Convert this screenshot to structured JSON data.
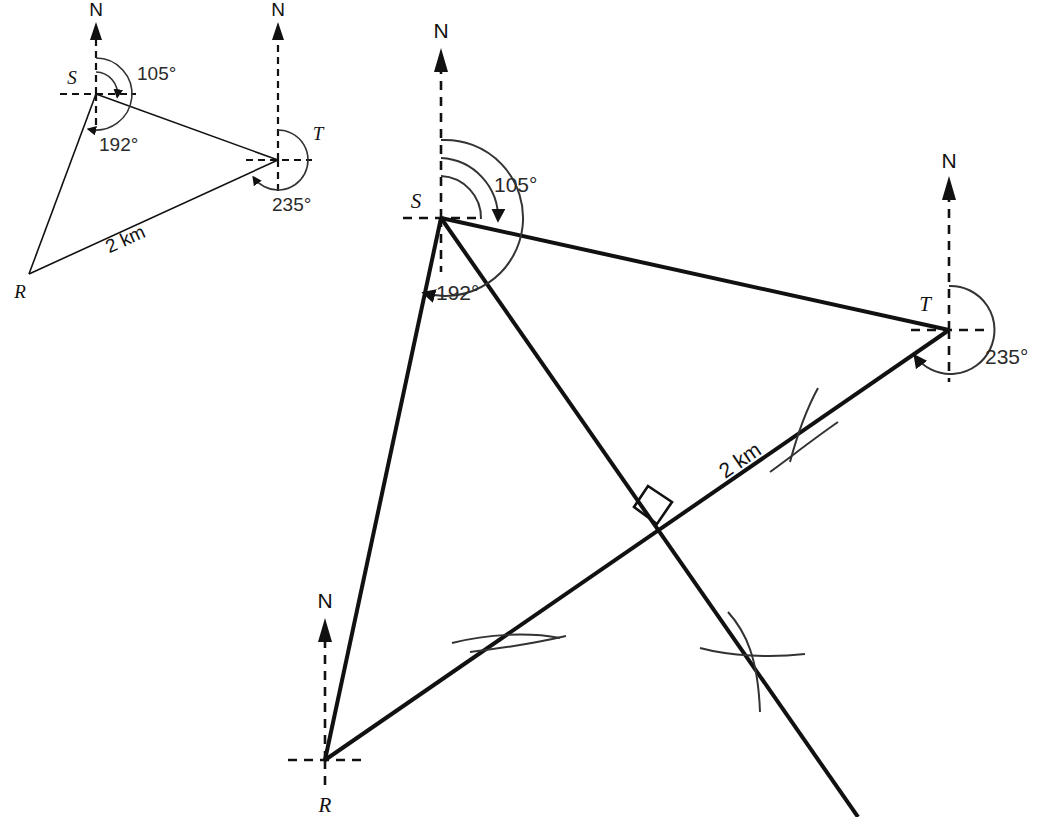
{
  "figure": {
    "type": "geometry-bearings-diagram",
    "background_color": "#ffffff",
    "ink_color": "#111111",
    "width": 1042,
    "height": 817
  },
  "small_diagram": {
    "name": "sketch-triangle-RST",
    "points": {
      "R": {
        "label": "R",
        "x": 29,
        "y": 274
      },
      "S": {
        "label": "S",
        "x": 96,
        "y": 94
      },
      "T": {
        "label": "T",
        "x": 286,
        "y": 160
      }
    },
    "north_labels": [
      {
        "label": "N",
        "at": "S",
        "x": 96,
        "y": 18
      },
      {
        "label": "N",
        "at": "T",
        "x": 278,
        "y": 18
      }
    ],
    "angles": [
      {
        "label": "105°",
        "vertex": "S",
        "x": 137,
        "y": 80,
        "value": 105
      },
      {
        "label": "192°",
        "vertex": "S",
        "x": 99,
        "y": 151,
        "value": 192
      },
      {
        "label": "235°",
        "vertex": "T",
        "x": 272,
        "y": 211,
        "value": 235
      }
    ],
    "lengths": [
      {
        "label": "2 km",
        "between": "R-T",
        "x": 128,
        "y": 245,
        "value": 2,
        "unit": "km"
      }
    ]
  },
  "main_diagram": {
    "name": "construction-triangle-RST",
    "points": {
      "R": {
        "label": "R",
        "x": 325,
        "y": 760
      },
      "S": {
        "label": "S",
        "x": 441,
        "y": 218
      },
      "T": {
        "label": "T",
        "x": 949,
        "y": 330
      }
    },
    "north_labels": [
      {
        "label": "N",
        "at": "S",
        "x": 441,
        "y": 38
      },
      {
        "label": "N",
        "at": "T",
        "x": 949,
        "y": 178
      },
      {
        "label": "N",
        "at": "R",
        "x": 325,
        "y": 608
      }
    ],
    "angles": [
      {
        "label": "105°",
        "vertex": "S",
        "x": 521,
        "y": 190,
        "value": 105
      },
      {
        "label": "192°",
        "vertex": "S",
        "x": 463,
        "y": 296,
        "value": 192
      },
      {
        "label": "235°",
        "vertex": "T",
        "x": 1000,
        "y": 356,
        "value": 235
      }
    ],
    "lengths": [
      {
        "label": "2 km",
        "between": "R-T",
        "x": 744,
        "y": 466,
        "value": 2,
        "unit": "km",
        "rotation_deg": -28
      }
    ],
    "marks": {
      "right_angle": {
        "name": "right-angle-mark",
        "x": 662,
        "y": 505
      },
      "arc_ticks": [
        {
          "name": "perpendicular-bisector-arc-upper",
          "x": 806,
          "y": 432
        },
        {
          "name": "perpendicular-bisector-arc-lower",
          "x": 502,
          "y": 643
        },
        {
          "name": "construction-arc-cross",
          "x": 752,
          "y": 654
        }
      ]
    }
  }
}
